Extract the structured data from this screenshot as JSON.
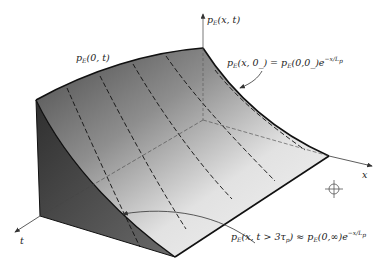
{
  "figure": {
    "type": "3d-surface-diagram",
    "axes": {
      "vertical": {
        "label": "p_E(x, t)",
        "parts": [
          "p",
          "E",
          "(x, t)"
        ]
      },
      "x": {
        "label": "x"
      },
      "t": {
        "label": "t"
      }
    },
    "labels": {
      "edge_t": {
        "text": "p_E(0, t)",
        "p": "p",
        "sub": "E",
        "rest": "(0, t)"
      },
      "initial_profile": {
        "text": "p_E(x, 0_) = p_E(0,0_) e^{-x/L_p}",
        "lhs_p": "p",
        "lhs_sub": "E",
        "lhs_rest": "(x, 0_) = ",
        "rhs_p": "p",
        "rhs_sub": "E",
        "rhs_rest": "(0,0_)e",
        "exp": "−x/L",
        "exp_sub": "p"
      },
      "steady_profile": {
        "text": "p_E(x, t > 3τ_p) ≈ p_E(0,∞) e^{-x/L_p}",
        "lhs_p": "p",
        "lhs_sub": "E",
        "lhs_rest1": "(x, t > 3τ",
        "lhs_sub2": "p",
        "lhs_rest2": ") ≈ ",
        "rhs_p": "p",
        "rhs_sub": "E",
        "rhs_rest": "(0,∞)e",
        "exp": "−x/L",
        "exp_sub": "p"
      }
    },
    "colors": {
      "surface_dark": "#3a3a3a",
      "surface_mid": "#9a9a9a",
      "surface_light": "#f0f0f0",
      "side_face": "#4a4a4a",
      "lines": "#111111",
      "axis": "#333333"
    },
    "registration_mark": "crosshair-circle"
  }
}
